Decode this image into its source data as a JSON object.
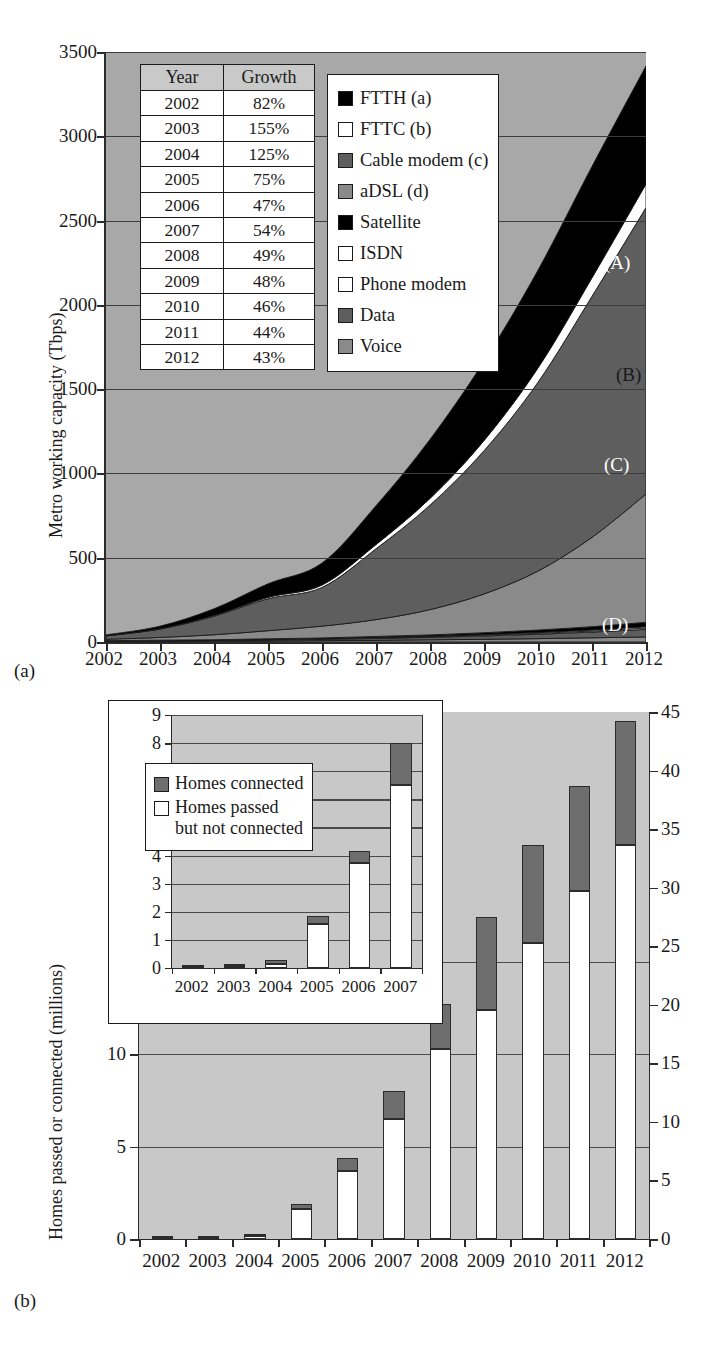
{
  "figure_a": {
    "panel_label": "(a)",
    "y_axis_title": "Metro working capacity (Tbps)",
    "y_ticks": [
      "0",
      "500",
      "1000",
      "1500",
      "2000",
      "2500",
      "3000",
      "3500"
    ],
    "x_ticks": [
      "2002",
      "2003",
      "2004",
      "2005",
      "2006",
      "2007",
      "2008",
      "2009",
      "2010",
      "2011",
      "2012"
    ],
    "table": {
      "headers": [
        "Year",
        "Growth"
      ],
      "rows": [
        [
          "2002",
          "82%"
        ],
        [
          "2003",
          "155%"
        ],
        [
          "2004",
          "125%"
        ],
        [
          "2005",
          "75%"
        ],
        [
          "2006",
          "47%"
        ],
        [
          "2007",
          "54%"
        ],
        [
          "2008",
          "49%"
        ],
        [
          "2009",
          "48%"
        ],
        [
          "2010",
          "46%"
        ],
        [
          "2011",
          "44%"
        ],
        [
          "2012",
          "43%"
        ]
      ]
    },
    "legend": [
      {
        "label": "FTTH (a)",
        "color": "#000000"
      },
      {
        "label": "FTTC (b)",
        "color": "#ffffff"
      },
      {
        "label": "Cable modem (c)",
        "color": "#5e5e5e"
      },
      {
        "label": "aDSL (d)",
        "color": "#8a8a8a"
      },
      {
        "label": "Satellite",
        "color": "#000000"
      },
      {
        "label": "ISDN",
        "color": "#ffffff"
      },
      {
        "label": "Phone modem",
        "color": "#ffffff"
      },
      {
        "label": "Data",
        "color": "#5e5e5e"
      },
      {
        "label": "Voice",
        "color": "#8a8a8a"
      }
    ],
    "band_letters": [
      "(A)",
      "(B)",
      "(C)",
      "(D)"
    ]
  },
  "figure_b": {
    "panel_label": "(b)",
    "y_axis_title": "Homes passed or connected (millions)",
    "left_y_ticks": [
      "0",
      "5",
      "10",
      "15"
    ],
    "right_y_ticks": [
      "0",
      "5",
      "10",
      "15",
      "20",
      "25",
      "30",
      "35",
      "40",
      "45"
    ],
    "x_ticks": [
      "2002",
      "2003",
      "2004",
      "2005",
      "2006",
      "2007",
      "2008",
      "2009",
      "2010",
      "2011",
      "2012"
    ],
    "inset": {
      "y_ticks": [
        "0",
        "1",
        "2",
        "3",
        "4",
        "5",
        "6",
        "7",
        "8",
        "9"
      ],
      "x_ticks": [
        "2002",
        "2003",
        "2004",
        "2005",
        "2006",
        "2007"
      ],
      "legend": [
        {
          "label": "Homes connected",
          "color": "#6e6e6e"
        },
        {
          "label": "Homes passed\nbut not connected",
          "color": "#ffffff"
        }
      ]
    }
  },
  "chart_data": [
    {
      "type": "area",
      "title": "",
      "xlabel": "",
      "ylabel": "Metro working capacity (Tbps)",
      "x": [
        2002,
        2003,
        2004,
        2005,
        2006,
        2007,
        2008,
        2009,
        2010,
        2011,
        2012
      ],
      "xlim": [
        2002,
        2012
      ],
      "ylim": [
        0,
        3500
      ],
      "grid": true,
      "stacked": true,
      "legend_position": "inside-top-center",
      "annotations": [
        {
          "text": "(A)",
          "series": "FTTH (a)"
        },
        {
          "text": "(B)",
          "series": "FTTC (b)"
        },
        {
          "text": "(C)",
          "series": "Cable modem (c)"
        },
        {
          "text": "(D)",
          "series": "aDSL (d)"
        }
      ],
      "series": [
        {
          "name": "Voice",
          "color": "#8a8a8a",
          "values": [
            3,
            4,
            5,
            6,
            8,
            10,
            13,
            16,
            20,
            25,
            30
          ]
        },
        {
          "name": "Data",
          "color": "#5e5e5e",
          "values": [
            2,
            3,
            4,
            6,
            8,
            11,
            15,
            20,
            26,
            34,
            45
          ]
        },
        {
          "name": "Phone modem",
          "color": "#ffffff",
          "values": [
            1,
            1,
            1,
            2,
            2,
            3,
            3,
            4,
            5,
            6,
            8
          ]
        },
        {
          "name": "ISDN",
          "color": "#ffffff",
          "values": [
            1,
            1,
            1,
            2,
            2,
            3,
            3,
            4,
            5,
            6,
            7
          ]
        },
        {
          "name": "Satellite",
          "color": "#000000",
          "values": [
            1,
            2,
            2,
            3,
            4,
            6,
            8,
            11,
            15,
            20,
            27
          ]
        },
        {
          "name": "aDSL (d)",
          "color": "#8a8a8a",
          "values": [
            8,
            16,
            30,
            48,
            70,
            100,
            150,
            230,
            350,
            530,
            760
          ]
        },
        {
          "name": "Cable modem (c)",
          "color": "#5e5e5e",
          "values": [
            20,
            50,
            110,
            190,
            230,
            420,
            620,
            850,
            1120,
            1430,
            1700
          ]
        },
        {
          "name": "FTTC (b)",
          "color": "#ffffff",
          "values": [
            1,
            2,
            4,
            8,
            14,
            25,
            40,
            60,
            85,
            110,
            140
          ]
        },
        {
          "name": "FTTH (a)",
          "color": "#000000",
          "values": [
            5,
            15,
            40,
            80,
            130,
            230,
            350,
            470,
            580,
            660,
            700
          ]
        }
      ],
      "totals": [
        40,
        95,
        200,
        350,
        470,
        810,
        1200,
        1660,
        2200,
        2810,
        3300
      ],
      "growth_table": {
        "headers": [
          "Year",
          "Growth"
        ],
        "Year": [
          "2002",
          "2003",
          "2004",
          "2005",
          "2006",
          "2007",
          "2008",
          "2009",
          "2010",
          "2011",
          "2012"
        ],
        "Growth": [
          "82%",
          "155%",
          "125%",
          "75%",
          "47%",
          "54%",
          "49%",
          "48%",
          "46%",
          "44%",
          "43%"
        ]
      }
    },
    {
      "type": "bar",
      "title": "",
      "xlabel": "",
      "ylabel": "Homes passed or connected (millions)",
      "stacked": true,
      "grid": true,
      "categories": [
        "2002",
        "2003",
        "2004",
        "2005",
        "2006",
        "2007",
        "2008",
        "2009",
        "2010",
        "2011",
        "2012"
      ],
      "ylim": [
        0,
        28.5
      ],
      "right_axis": {
        "ylim": [
          0,
          45
        ],
        "ticks": [
          0,
          5,
          10,
          15,
          20,
          25,
          30,
          35,
          40,
          45
        ]
      },
      "left_axis": {
        "ticks": [
          0,
          5,
          10,
          15
        ]
      },
      "series": [
        {
          "name": "Homes passed but not connected",
          "color": "#ffffff",
          "values": [
            0.05,
            0.08,
            0.15,
            1.6,
            3.7,
            6.5,
            10.3,
            12.4,
            16.0,
            18.8,
            21.3
          ]
        },
        {
          "name": "Homes connected",
          "color": "#6e6e6e",
          "values": [
            0.02,
            0.07,
            0.13,
            0.3,
            0.7,
            1.5,
            2.4,
            5.0,
            5.3,
            5.7,
            6.7
          ]
        }
      ],
      "totals": [
        0.07,
        0.15,
        0.28,
        1.9,
        4.4,
        8.0,
        12.7,
        17.4,
        21.3,
        24.5,
        28.0
      ]
    },
    {
      "type": "bar",
      "title": "",
      "stacked": true,
      "grid": true,
      "inset": true,
      "categories": [
        "2002",
        "2003",
        "2004",
        "2005",
        "2006",
        "2007"
      ],
      "ylim": [
        0,
        9
      ],
      "left_axis": {
        "ticks": [
          0,
          1,
          2,
          3,
          4,
          5,
          6,
          7,
          8,
          9
        ]
      },
      "series": [
        {
          "name": "Homes passed but not connected",
          "color": "#ffffff",
          "values": [
            0.05,
            0.08,
            0.15,
            1.55,
            3.75,
            6.5
          ]
        },
        {
          "name": "Homes connected",
          "color": "#6e6e6e",
          "values": [
            0.03,
            0.07,
            0.13,
            0.3,
            0.4,
            1.5
          ]
        }
      ],
      "totals": [
        0.08,
        0.15,
        0.28,
        1.85,
        4.15,
        8.0
      ]
    }
  ]
}
